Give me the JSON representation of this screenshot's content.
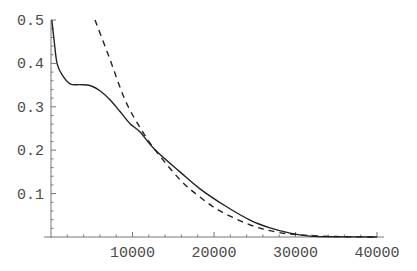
{
  "chart_data": {
    "type": "line",
    "title": "",
    "xlabel": "",
    "ylabel": "",
    "xlim": [
      0,
      40000
    ],
    "ylim": [
      0,
      0.5
    ],
    "grid": false,
    "legend": null,
    "x_ticks": [
      10000,
      20000,
      30000,
      40000
    ],
    "x_tick_labels": [
      "10000",
      "20000",
      "30000",
      "40000"
    ],
    "y_ticks": [
      0.1,
      0.2,
      0.3,
      0.4,
      0.5
    ],
    "y_tick_labels": [
      "0.1",
      "0.2",
      "0.3",
      "0.4",
      "0.5"
    ],
    "series": [
      {
        "name": "solid",
        "style": "solid",
        "color": "#222222",
        "x": [
          100,
          370,
          740,
          1350,
          2330,
          3560,
          4790,
          6010,
          7240,
          8470,
          9700,
          10930,
          12760,
          15830,
          18280,
          21350,
          24420,
          26870,
          29330,
          31780,
          35000,
          40000
        ],
        "y": [
          0.5,
          0.455,
          0.4,
          0.374,
          0.353,
          0.351,
          0.349,
          0.337,
          0.316,
          0.289,
          0.261,
          0.242,
          0.201,
          0.15,
          0.111,
          0.072,
          0.039,
          0.021,
          0.009,
          0.002,
          0.0005,
          0.0
        ]
      },
      {
        "name": "dashed",
        "style": "dashed",
        "color": "#222222",
        "x": [
          5400,
          7240,
          9080,
          10930,
          12760,
          15830,
          18280,
          20740,
          24420,
          27480,
          30550,
          35000,
          40000
        ],
        "y": [
          0.5,
          0.409,
          0.316,
          0.252,
          0.201,
          0.132,
          0.092,
          0.06,
          0.028,
          0.012,
          0.005,
          0.001,
          0.0
        ]
      }
    ]
  }
}
